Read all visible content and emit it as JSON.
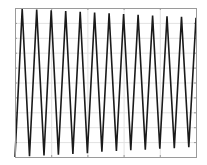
{
  "chart_data": {
    "type": "line",
    "title": "",
    "xlabel": "",
    "ylabel": "",
    "xlim": [
      0,
      25
    ],
    "ylim": [
      -1,
      1
    ],
    "grid": true,
    "legend": null,
    "x_gridlines": 5,
    "y_gridlines": 10,
    "series": [
      {
        "name": "triangle-wave",
        "color": "#1a1a1a",
        "x": [
          0,
          0.5,
          1,
          1.5,
          2,
          2.5,
          3,
          3.5,
          4,
          4.5,
          5,
          5.5,
          6,
          6.5,
          7,
          7.5,
          8,
          8.5,
          9,
          9.5,
          10,
          10.5,
          11,
          11.5,
          12,
          12.5
        ],
        "y": [
          -1.0,
          0.99,
          -0.99,
          0.98,
          -0.98,
          0.97,
          -0.97,
          0.96,
          -0.96,
          0.95,
          -0.95,
          0.94,
          -0.93,
          0.93,
          -0.92,
          0.92,
          -0.91,
          0.91,
          -0.9,
          0.9,
          -0.89,
          0.89,
          -0.88,
          0.88,
          -0.87,
          0.87
        ]
      }
    ]
  },
  "plot": {
    "frame_color": "#9a9a9a",
    "grid_color": "#e2e2e2",
    "line_color": "#1a1a1a",
    "left": 15,
    "top": 8,
    "right": 196,
    "bottom": 157
  }
}
